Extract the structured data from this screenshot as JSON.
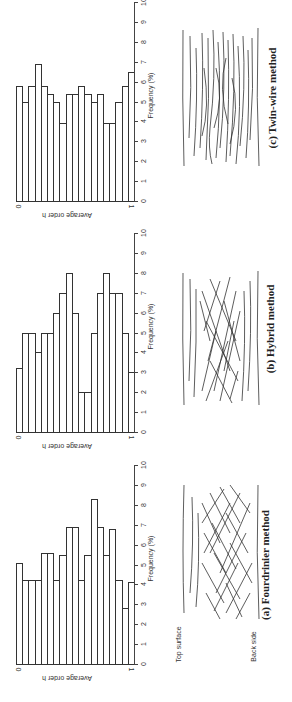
{
  "figure": {
    "orientation": "rotated 90deg counter-clockwise",
    "panels": [
      {
        "id": "c",
        "title": "(c) Twin-wire method",
        "xlabel": "Average order h",
        "ylabel": "Frequency (%)",
        "x_ticks": [
          "0",
          "1"
        ],
        "y_ticks": [
          "0",
          "1",
          "2",
          "3",
          "4",
          "5",
          "6",
          "7",
          "8",
          "9",
          "10"
        ]
      },
      {
        "id": "b",
        "title": "(b) Hybrid method",
        "xlabel": "Average order h",
        "ylabel": "Frequency (%)",
        "x_ticks": [
          "0",
          "1"
        ],
        "y_ticks": [
          "0",
          "1",
          "2",
          "3",
          "4",
          "5",
          "6",
          "7",
          "8",
          "9",
          "10"
        ]
      },
      {
        "id": "a",
        "title": "(a) Fourdrinier method",
        "xlabel": "Average order h",
        "ylabel": "Frequency (%)",
        "x_ticks": [
          "0",
          "1"
        ],
        "y_ticks": [
          "0",
          "1",
          "2",
          "3",
          "4",
          "5",
          "6",
          "7",
          "8",
          "9",
          "10"
        ],
        "diagram_labels": {
          "top": "Top surface",
          "back": "Back side"
        }
      }
    ]
  },
  "chart_data": [
    {
      "type": "bar",
      "title": "(a) Fourdrinier method",
      "xlabel": "Average order h",
      "ylabel": "Frequency (%)",
      "xlim": [
        0,
        1
      ],
      "ylim": [
        0,
        10
      ],
      "bins": 19,
      "values": [
        5.1,
        4.2,
        4.2,
        4.2,
        5.6,
        5.6,
        4.2,
        5.5,
        6.9,
        6.9,
        4.2,
        5.5,
        8.3,
        6.9,
        5.5,
        6.8,
        4.2,
        2.8,
        4.1
      ]
    },
    {
      "type": "bar",
      "title": "(b) Hybrid method",
      "xlabel": "Average order h",
      "ylabel": "Frequency (%)",
      "xlim": [
        0,
        1
      ],
      "ylim": [
        0,
        10
      ],
      "bins": 19,
      "values": [
        3.2,
        5.0,
        5.0,
        4.0,
        5.0,
        5.0,
        6.0,
        7.0,
        8.0,
        6.0,
        2.0,
        2.0,
        5.0,
        7.0,
        8.0,
        7.0,
        7.0,
        5.0,
        3.0
      ]
    },
    {
      "type": "bar",
      "title": "(c) Twin-wire method",
      "xlabel": "Average order h",
      "ylabel": "Frequency (%)",
      "xlim": [
        0,
        1
      ],
      "ylim": [
        0,
        10
      ],
      "bins": 19,
      "values": [
        5.8,
        5.0,
        5.8,
        6.9,
        5.8,
        5.4,
        5.0,
        3.9,
        5.4,
        5.4,
        5.8,
        5.4,
        5.0,
        5.4,
        3.9,
        3.9,
        5.0,
        5.8,
        6.5
      ]
    }
  ]
}
